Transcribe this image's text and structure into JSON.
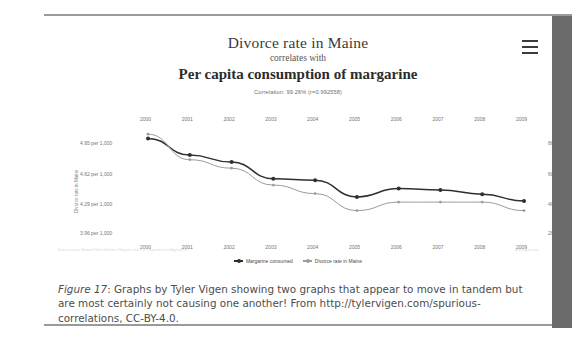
{
  "figure": {
    "caption_label": "Figure 17",
    "caption_sep": ": ",
    "caption_text": "Graphs by Tyler Vigen showing two graphs that appear to move in tandem but are most certainly not causing one another! From http://tylervigen.com/spurious-correlations, CC-BY-4.0."
  },
  "chart_card": {
    "menu_icon": "hamburger-menu-icon",
    "source_note_left": "Data sources: National Vital Statistics Reports and U.S. Department of Agriculture",
    "source_note_right": "tylervigen.com"
  },
  "chart_data": {
    "type": "line",
    "title": "Divorce rate in Maine",
    "connector": "correlates with",
    "subtitle": "Per capita consumption of margarine",
    "annotation": "Correlation: 99.26% (r=0.992558)",
    "correlation_percent": "99.26%",
    "correlation_r": "0.992558",
    "x": [
      2000,
      2001,
      2002,
      2003,
      2004,
      2005,
      2006,
      2007,
      2008,
      2009
    ],
    "categories": [
      "2000",
      "2001",
      "2002",
      "2003",
      "2004",
      "2005",
      "2006",
      "2007",
      "2008",
      "2009"
    ],
    "xlabel": "",
    "grid": false,
    "legend_position": "bottom",
    "axes": {
      "left": {
        "label": "Divorce rate in Maine",
        "ticks": [
          "3.96 per 1,000",
          "4.29 per 1,000",
          "4.62 per 1,000",
          "4.95 per 1,000"
        ],
        "tick_values": [
          3.96,
          4.29,
          4.62,
          4.95
        ],
        "ylim": [
          3.8,
          5.05
        ]
      },
      "right": {
        "label": "Margarine consumed",
        "ticks": [
          "2lbs",
          "4lbs",
          "6lbs",
          "8lbs"
        ],
        "tick_values": [
          2,
          4,
          6,
          8
        ],
        "ylim": [
          1.2,
          8.8
        ]
      }
    },
    "series": [
      {
        "name": "Margarine consumed",
        "axis": "right",
        "color": "#2f2f2f",
        "units": "lbs",
        "values": [
          8.2,
          7.0,
          6.5,
          5.3,
          5.2,
          4.0,
          4.6,
          4.5,
          4.2,
          3.7
        ]
      },
      {
        "name": "Divorce rate in Maine",
        "axis": "left",
        "color": "#9c9c9c",
        "units": "per 1,000",
        "values": [
          5.0,
          4.7,
          4.6,
          4.4,
          4.3,
          4.1,
          4.2,
          4.2,
          4.2,
          4.1
        ]
      }
    ]
  }
}
